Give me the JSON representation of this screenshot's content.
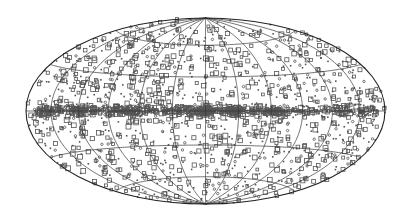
{
  "chart_data": {
    "type": "scatter",
    "title": "",
    "projection": "hammer-aitoff",
    "xlabel": "",
    "ylabel": "",
    "grid": true,
    "legend": null,
    "coordinate_system": "galactic (all-sky)",
    "graticule": {
      "meridian_step_deg": 30,
      "parallel_step_deg": 30
    },
    "xlim_deg": [
      -180,
      180
    ],
    "ylim_deg": [
      -90,
      90
    ],
    "frame": {
      "cx": 205.5,
      "cy": 111,
      "a": 179.5,
      "b": 93
    },
    "colors": {
      "background": "#ffffff",
      "grid": "#333333",
      "outline": "#222222",
      "marker": "#555555"
    },
    "markers": [
      "open-square",
      "dot"
    ],
    "distribution": {
      "seed": 7,
      "isotropic_count": 1300,
      "plane_count": 650,
      "plane_width_deg": 2.2,
      "clusters": [
        {
          "lon": 0,
          "lat": 0,
          "n": 90,
          "spread": 6
        },
        {
          "lon": -25,
          "lat": 0,
          "n": 60,
          "spread": 5
        },
        {
          "lon": -65,
          "lat": -1,
          "n": 45,
          "spread": 5
        },
        {
          "lon": 75,
          "lat": 0,
          "n": 40,
          "spread": 6
        },
        {
          "lon": 120,
          "lat": 0,
          "n": 30,
          "spread": 6
        }
      ]
    }
  }
}
